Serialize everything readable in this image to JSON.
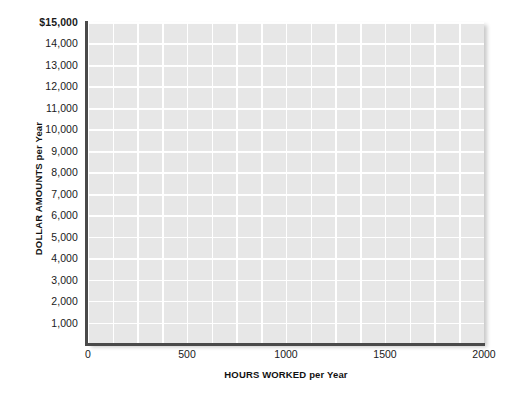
{
  "chart_data": {
    "type": "line",
    "title": "",
    "subtitle": "",
    "xlabel": "HOURS WORKED per Year",
    "ylabel": "DOLLAR AMOUNTS per Year",
    "xlim": [
      0,
      2000
    ],
    "ylim": [
      0,
      15000
    ],
    "x_ticks": [
      0,
      500,
      1000,
      1500,
      2000
    ],
    "x_tick_labels": [
      "0",
      "500",
      "1000",
      "1500",
      "2000"
    ],
    "y_ticks": [
      1000,
      2000,
      3000,
      4000,
      5000,
      6000,
      7000,
      8000,
      9000,
      10000,
      11000,
      12000,
      13000,
      14000,
      15000
    ],
    "y_tick_labels": [
      "1,000",
      "2,000",
      "3,000",
      "4,000",
      "5,000",
      "6,000",
      "7,000",
      "8,000",
      "9,000",
      "10,000",
      "11,000",
      "12,000",
      "13,000",
      "14,000",
      "$15,000"
    ],
    "x_minor_tick_interval": 125,
    "y_minor_tick_interval": 1000,
    "grid": true,
    "grid_color": "#ffffff",
    "plot_background": "#e7e7e7",
    "figure_background": "#ffffff",
    "axis_color": "#4a4a4a",
    "legend": null,
    "legend_position": "none",
    "series": [],
    "values": [],
    "categories": [],
    "annotations": [],
    "note": "Blank grid template with no plotted data series"
  },
  "axes": {
    "y_axis": {
      "label": "DOLLAR AMOUNTS per Year",
      "ticks": [
        {
          "value": 15000,
          "label": "$15,000"
        },
        {
          "value": 14000,
          "label": "14,000"
        },
        {
          "value": 13000,
          "label": "13,000"
        },
        {
          "value": 12000,
          "label": "12,000"
        },
        {
          "value": 11000,
          "label": "11,000"
        },
        {
          "value": 10000,
          "label": "10,000"
        },
        {
          "value": 9000,
          "label": "9,000"
        },
        {
          "value": 8000,
          "label": "8,000"
        },
        {
          "value": 7000,
          "label": "7,000"
        },
        {
          "value": 6000,
          "label": "6,000"
        },
        {
          "value": 5000,
          "label": "5,000"
        },
        {
          "value": 4000,
          "label": "4,000"
        },
        {
          "value": 3000,
          "label": "3,000"
        },
        {
          "value": 2000,
          "label": "2,000"
        },
        {
          "value": 1000,
          "label": "1,000"
        }
      ]
    },
    "x_axis": {
      "label": "HOURS WORKED per Year",
      "ticks": [
        {
          "value": 0,
          "label": "0"
        },
        {
          "value": 500,
          "label": "500"
        },
        {
          "value": 1000,
          "label": "1000"
        },
        {
          "value": 1500,
          "label": "1500"
        },
        {
          "value": 2000,
          "label": "2000"
        }
      ]
    }
  }
}
